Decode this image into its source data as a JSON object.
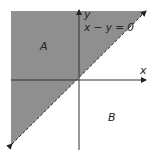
{
  "diagram": {
    "region_a_label": "A",
    "region_b_label": "B",
    "x_axis_label": "x",
    "y_axis_label": "y",
    "line_equation": "x − y = 0",
    "colors": {
      "shaded_region": "#8f8f8f",
      "axes": "#333333",
      "boundary": "#222222",
      "background": "#ffffff"
    }
  }
}
